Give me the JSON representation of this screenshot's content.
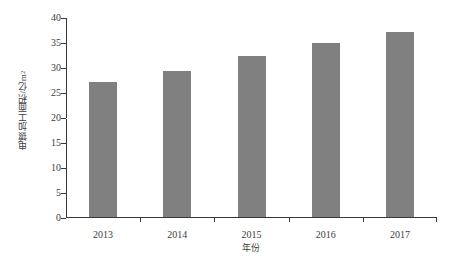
{
  "chart_data": {
    "type": "bar",
    "title": "",
    "xlabel": "年份",
    "ylabel": "电镀加工面积/亿m²",
    "categories": [
      "2013",
      "2014",
      "2015",
      "2016",
      "2017"
    ],
    "values": [
      27.0,
      29.2,
      32.2,
      34.9,
      37.0
    ],
    "series": [
      {
        "name": "电镀加工面积",
        "values": [
          27.0,
          29.2,
          32.2,
          34.9,
          37.0
        ]
      }
    ],
    "ylim": [
      0,
      40
    ],
    "ytick_values": [
      "40",
      "35",
      "30",
      "25",
      "20",
      "15",
      "10",
      "5",
      "0"
    ],
    "ytick_numbers": [
      40,
      35,
      30,
      25,
      20,
      15,
      10,
      5,
      0
    ],
    "grid": false,
    "legend": "none",
    "bar_color": "#808080",
    "axis_color": "#3a3a3a",
    "text_color": "#3d3d3d",
    "background_color": "#ffffff",
    "ylabel_unit_base": "电镀加工面积/亿m",
    "ylabel_unit_exponent": "2"
  }
}
